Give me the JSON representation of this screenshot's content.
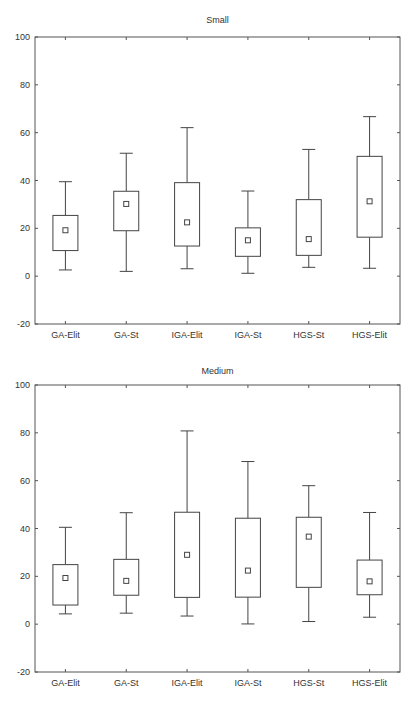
{
  "chart_data": [
    {
      "type": "box",
      "title": "Small",
      "xlabel": "",
      "ylabel": "",
      "ylim": [
        -20,
        100
      ],
      "yticks": [
        -20,
        0,
        20,
        40,
        60,
        80,
        100
      ],
      "grid": false,
      "legend": null,
      "categories": [
        "GA-Elit",
        "GA-St",
        "IGA-Elit",
        "IGA-St",
        "HGS-St",
        "HGS-Elit"
      ],
      "series": [
        {
          "name": "whisker_min",
          "values": [
            2.6,
            2.0,
            3.1,
            1.2,
            3.7,
            3.3
          ]
        },
        {
          "name": "box_low",
          "values": [
            10.7,
            19.0,
            12.6,
            8.3,
            8.7,
            16.3
          ]
        },
        {
          "name": "mean",
          "values": [
            19.2,
            30.2,
            22.5,
            15.0,
            15.5,
            31.3
          ]
        },
        {
          "name": "box_high",
          "values": [
            25.4,
            35.5,
            39.1,
            20.2,
            32.0,
            50.1
          ]
        },
        {
          "name": "whisker_max",
          "values": [
            39.5,
            51.4,
            62.1,
            35.6,
            53.0,
            66.7
          ]
        }
      ]
    },
    {
      "type": "box",
      "title": "Medium",
      "xlabel": "",
      "ylabel": "",
      "ylim": [
        -20,
        100
      ],
      "yticks": [
        -20,
        0,
        20,
        40,
        60,
        80,
        100
      ],
      "grid": false,
      "legend": null,
      "categories": [
        "GA-Elit",
        "GA-St",
        "IGA-Elit",
        "IGA-St",
        "HGS-St",
        "HGS-Elit"
      ],
      "series": [
        {
          "name": "whisker_min",
          "values": [
            4.3,
            4.6,
            3.4,
            0.1,
            1.1,
            2.9
          ]
        },
        {
          "name": "box_low",
          "values": [
            8.0,
            12.1,
            11.2,
            11.3,
            15.4,
            12.3
          ]
        },
        {
          "name": "mean",
          "values": [
            19.3,
            18.1,
            29.0,
            22.4,
            36.6,
            17.9
          ]
        },
        {
          "name": "box_high",
          "values": [
            24.9,
            27.1,
            46.8,
            44.3,
            44.7,
            26.8
          ]
        },
        {
          "name": "whisker_max",
          "values": [
            40.5,
            46.6,
            80.8,
            68.0,
            57.9,
            46.7
          ]
        }
      ]
    }
  ],
  "charts": [
    {
      "title": "Small"
    },
    {
      "title": "Medium"
    }
  ],
  "style": {
    "line_color": "#444444",
    "axis_color": "#555555",
    "background": "#ffffff"
  }
}
